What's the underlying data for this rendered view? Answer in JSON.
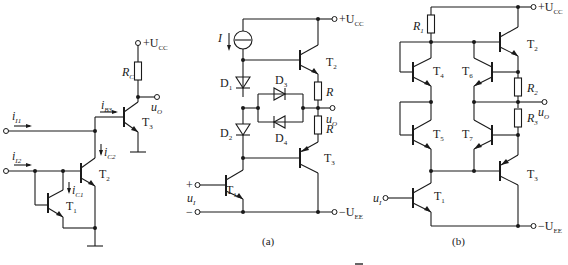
{
  "figure": {
    "circuit_left": {
      "supply": "+U",
      "supply_sub": "CC",
      "resistor": "R",
      "resistor_sub": "C",
      "output": "u",
      "output_sub": "O",
      "inputs": [
        {
          "label": "i",
          "sub": "I1"
        },
        {
          "label": "i",
          "sub": "I2"
        }
      ],
      "currents": [
        {
          "label": "i",
          "sub": "B3"
        },
        {
          "label": "i",
          "sub": "C2"
        },
        {
          "label": "i",
          "sub": "C1"
        }
      ],
      "transistors": [
        {
          "label": "T",
          "sub": "1"
        },
        {
          "label": "T",
          "sub": "2"
        },
        {
          "label": "T",
          "sub": "3"
        }
      ]
    },
    "circuit_a": {
      "caption": "(a)",
      "supply_pos": "+U",
      "supply_pos_sub": "CC",
      "supply_neg": "−U",
      "supply_neg_sub": "EE",
      "current_source": "I",
      "diodes": [
        {
          "label": "D",
          "sub": "1"
        },
        {
          "label": "D",
          "sub": "2"
        },
        {
          "label": "D",
          "sub": "3"
        },
        {
          "label": "D",
          "sub": "4"
        }
      ],
      "resistors": [
        "R",
        "R"
      ],
      "output": "u",
      "output_sub": "O",
      "input": "u",
      "input_sub": "I",
      "input_plus": "+",
      "input_minus": "−",
      "transistors": [
        {
          "label": "T",
          "sub": "1"
        },
        {
          "label": "T",
          "sub": "2"
        },
        {
          "label": "T",
          "sub": "3"
        }
      ]
    },
    "circuit_b": {
      "caption": "(b)",
      "supply_pos": "+U",
      "supply_pos_sub": "CC",
      "supply_neg": "−U",
      "supply_neg_sub": "EE",
      "resistors": [
        {
          "label": "R",
          "sub": "1"
        },
        {
          "label": "R",
          "sub": "2"
        },
        {
          "label": "R",
          "sub": "3"
        }
      ],
      "output": "u",
      "output_sub": "O",
      "input": "u",
      "input_sub": "I",
      "transistors": [
        {
          "label": "T",
          "sub": "1"
        },
        {
          "label": "T",
          "sub": "2"
        },
        {
          "label": "T",
          "sub": "3"
        },
        {
          "label": "T",
          "sub": "4"
        },
        {
          "label": "T",
          "sub": "5"
        },
        {
          "label": "T",
          "sub": "6"
        },
        {
          "label": "T",
          "sub": "7"
        }
      ]
    },
    "bottom_caption": "图"
  }
}
